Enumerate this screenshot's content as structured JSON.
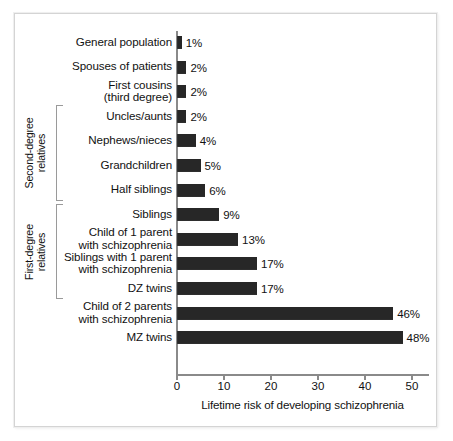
{
  "figure": {
    "frame_color": "#d4d4d4",
    "bar_color": "#272727",
    "axis_color": "#8a8a8a",
    "text_color": "#111111"
  },
  "chart_data": {
    "type": "bar",
    "orientation": "horizontal",
    "title": "",
    "xlabel": "Lifetime risk of developing schizophrenia",
    "ylabel": "",
    "xlim": [
      0,
      53
    ],
    "xticks": [
      0,
      10,
      20,
      30,
      40,
      50
    ],
    "xtick_labels": [
      "0",
      "10",
      "20",
      "30",
      "40",
      "50"
    ],
    "grid": false,
    "legend": null,
    "value_suffix": "%",
    "categories": [
      "General population",
      "Spouses of patients",
      "First cousins\n(third degree)",
      "Uncles/aunts",
      "Nephews/nieces",
      "Grandchildren",
      "Half siblings",
      "Siblings",
      "Child of 1 parent\nwith schizophrenia",
      "Siblings with 1 parent\nwith schizophrenia",
      "DZ twins",
      "Child of 2 parents\nwith schizophrenia",
      "MZ twins"
    ],
    "values": [
      1,
      2,
      2,
      2,
      4,
      5,
      6,
      9,
      13,
      17,
      17,
      46,
      48
    ],
    "value_labels": [
      "1%",
      "2%",
      "2%",
      "2%",
      "4%",
      "5%",
      "6%",
      "9%",
      "13%",
      "17%",
      "17%",
      "46%",
      "48%"
    ],
    "groups": [
      {
        "label": "Second-degree\nrelatives",
        "first_index": 3,
        "last_index": 6
      },
      {
        "label": "First-degree\nrelatives",
        "first_index": 7,
        "last_index": 10
      }
    ]
  }
}
